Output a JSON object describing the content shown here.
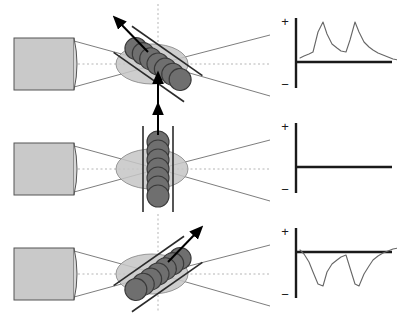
{
  "figure": {
    "width": 397,
    "height": 317,
    "panel_count": 3
  },
  "colors": {
    "source_fill": "#c9c9c9",
    "source_stroke": "#555555",
    "lens_fill": "#d6d6d6",
    "beam_stroke": "#6e6e6e",
    "cell_fill": "#6f6f6f",
    "cell_stroke": "#3a3a3a",
    "halo_fill": "#c6c6c6",
    "halo_stroke": "#8d8d8d",
    "axis_dash": "#b5b5b5",
    "arrow": "#000000",
    "rail": "#2b2b2b",
    "trace_axis": "#1a1a1a",
    "trace_line": "#666666",
    "background": "#ffffff"
  },
  "geometry": {
    "source_box": {
      "x": 14,
      "y": 38,
      "width": 60,
      "height": 52
    },
    "waist_x": 158,
    "beam_end_x": 270,
    "cell_count": 7,
    "cell_radius": 11,
    "cell_spacing": 9,
    "halo_rx": 36,
    "halo_ry": 20
  },
  "panels": [
    {
      "id": "panel-tilt-left",
      "label": "tilted left",
      "chain": {
        "orientation_name": "oblique-left",
        "angle_deg": -55,
        "rail_offset": 16
      },
      "motion_arrow": {
        "name": "motion-arrow-up-left",
        "direction": "up-left",
        "angle_deg": -55,
        "from": {
          "x": 148,
          "y": 52
        },
        "to": {
          "x": 118,
          "y": 21
        }
      },
      "stimulus_arrow": {
        "name": "stimulus-arrow-up",
        "direction": "up",
        "visible": true,
        "from": {
          "x": 158,
          "y": 104
        },
        "to": {
          "x": 158,
          "y": 78
        }
      },
      "vertical_axis": true,
      "trace": {
        "name": "response-trace-positive",
        "polarity": "positive",
        "plus_label": "+",
        "minus_label": "−",
        "spike_count": 2,
        "description": "two upward spikes with fast rise and slow decay",
        "baseline_y": 62,
        "points": "0,40 4,38 9,36 13,34 18,14 23,4 27,16 32,26 37,30 41,33 46,34 50,22 55,4 59,14 64,24 69,29 73,32 78,35 83,37 88,39 93,41 98,42"
      }
    },
    {
      "id": "panel-vertical",
      "label": "vertical",
      "chain": {
        "orientation_name": "vertical",
        "angle_deg": 0,
        "rail_offset": 15
      },
      "motion_arrow": {
        "name": "motion-arrow-up",
        "direction": "up",
        "angle_deg": 0,
        "from": {
          "x": 158,
          "y": 30
        },
        "to": {
          "x": 158,
          "y": 4
        }
      },
      "stimulus_arrow": {
        "name": "stimulus-arrow-none",
        "direction": "none",
        "visible": false,
        "from": {
          "x": 0,
          "y": 0
        },
        "to": {
          "x": 0,
          "y": 0
        }
      },
      "vertical_axis": true,
      "trace": {
        "name": "response-trace-flat",
        "polarity": "none",
        "plus_label": "+",
        "minus_label": "−",
        "spike_count": 0,
        "description": "flat baseline, no response",
        "baseline_y": 62,
        "points": ""
      }
    },
    {
      "id": "panel-tilt-right",
      "label": "tilted right",
      "chain": {
        "orientation_name": "oblique-right",
        "angle_deg": 55,
        "rail_offset": 16
      },
      "motion_arrow": {
        "name": "motion-arrow-up-right",
        "direction": "up-right",
        "angle_deg": 55,
        "from": {
          "x": 168,
          "y": 52
        },
        "to": {
          "x": 198,
          "y": 21
        }
      },
      "stimulus_arrow": {
        "name": "stimulus-arrow-none",
        "direction": "none",
        "visible": false,
        "from": {
          "x": 0,
          "y": 0
        },
        "to": {
          "x": 0,
          "y": 0
        }
      },
      "vertical_axis": true,
      "trace": {
        "name": "response-trace-negative",
        "polarity": "negative",
        "plus_label": "+",
        "minus_label": "−",
        "spike_count": 2,
        "description": "two downward spikes with fast fall and slow recovery",
        "baseline_y": 42,
        "points": "0,22 4,26 9,34 13,44 18,56 23,58 27,44 32,36 37,32 41,29 46,27 50,40 55,56 59,58 64,46 69,38 73,32 78,28 83,25 88,23 93,21 98,20"
      }
    }
  ]
}
